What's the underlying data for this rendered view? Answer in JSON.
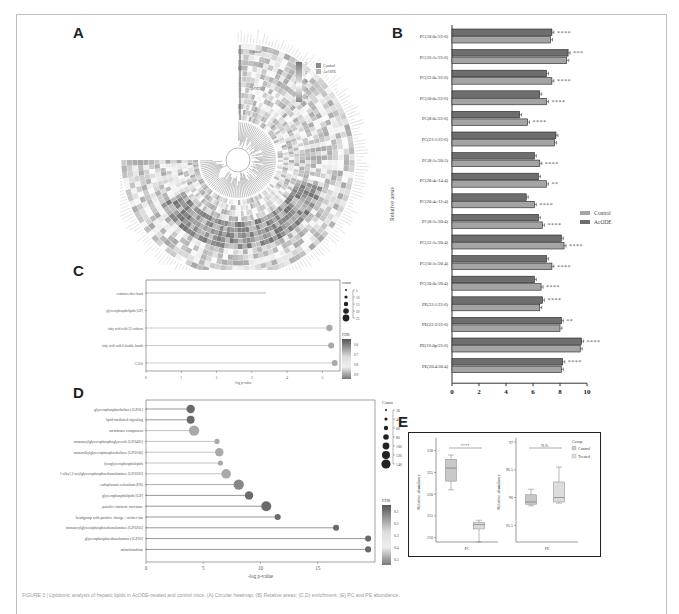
{
  "panels": {
    "A": {
      "letter": "A"
    },
    "B": {
      "letter": "B"
    },
    "C": {
      "letter": "C"
    },
    "D": {
      "letter": "D"
    },
    "E": {
      "letter": "E"
    }
  },
  "heatmap": {
    "group_labels": [
      "Control",
      "AcODE"
    ],
    "color_scale_ticks": [
      "2",
      "1",
      "0",
      "-1",
      "-2"
    ],
    "legend_groups": [
      "Control",
      "AcODE"
    ]
  },
  "chart_data": [
    {
      "panel": "A",
      "type": "heatmap",
      "title": "",
      "layout": "circular heatmap with dendrogram",
      "row_groups": [
        "Control",
        "AcODE"
      ],
      "color_scale": {
        "min": -2,
        "max": 2,
        "ticks": [
          2,
          1,
          0,
          -1,
          -2
        ]
      },
      "legend": [
        "Control",
        "AcODE"
      ]
    },
    {
      "panel": "B",
      "type": "bar",
      "orientation": "horizontal",
      "ylabel": "Relative areas",
      "xlabel": "",
      "xlim": [
        0,
        10
      ],
      "xticks": [
        0,
        2,
        4,
        6,
        8,
        10
      ],
      "legend_position": "right",
      "categories": [
        "PC(18:0e/22:6)",
        "PC(16:1e/22:6)",
        "PC(12:0e/22:6)",
        "PC(10:0e/22:6)",
        "PC(8:0e/22:6)",
        "PC(22:1/22:6)",
        "PC(8:1e/20:5)",
        "PC(20:4e/14:4)",
        "PC(20:4e/12:4)",
        "PC(8:1e/20:4)",
        "PC(12:1e/20:4)",
        "PC(10:1e/20:4)",
        "PC(10:0e/20:4)",
        "PE(32:1/22:6)",
        "PE(22:3/22:6)",
        "PE(16:0p/22:6)",
        "PE(20:4/20:4)"
      ],
      "series": [
        {
          "name": "Control",
          "values": [
            7.4,
            8.6,
            7.0,
            6.5,
            5.0,
            7.7,
            6.1,
            6.4,
            5.5,
            6.4,
            8.1,
            7.0,
            6.1,
            6.7,
            8.1,
            9.6,
            8.2
          ]
        },
        {
          "name": "AcODE",
          "values": [
            7.3,
            8.5,
            7.4,
            7.0,
            5.6,
            7.6,
            6.5,
            7.0,
            6.1,
            6.7,
            8.3,
            7.4,
            6.6,
            6.5,
            8.0,
            9.5,
            8.1
          ]
        }
      ],
      "significance": [
        "****",
        "***",
        "****",
        "****",
        "****",
        "",
        "****",
        "**",
        "****",
        "****",
        "****",
        "****",
        "****",
        "****",
        "**",
        "****",
        "****"
      ]
    },
    {
      "panel": "C",
      "type": "scatter",
      "subtype": "lollipop",
      "xlabel": "-log p-value",
      "ylabel": "",
      "xlim": [
        0,
        5.5
      ],
      "xticks": [
        0,
        1,
        2,
        3,
        4,
        5
      ],
      "categories": [
        "contains ether bond",
        "glycerophospholipids [GP]",
        "fatty acid with 22 carbons",
        "fatty acid with 6 double bonds",
        "C22:6"
      ],
      "values": [
        3.4,
        0.0,
        5.2,
        5.25,
        5.35
      ],
      "count": [
        null,
        null,
        15,
        12,
        10
      ],
      "fdr": [
        null,
        null,
        0.6,
        0.6,
        0.6
      ],
      "legend": {
        "count_title": "count",
        "count_ticks": [
          5,
          10,
          15,
          20,
          25
        ],
        "fdr_title": "FDR",
        "fdr_ticks": [
          0.6,
          0.7,
          0.8,
          0.9
        ]
      }
    },
    {
      "panel": "D",
      "type": "scatter",
      "subtype": "lollipop",
      "xlabel": "-log p-value",
      "ylabel": "",
      "xlim": [
        0,
        20
      ],
      "xticks": [
        0,
        5,
        10,
        15
      ],
      "categories": [
        "glycerophosphocholines [GP01]",
        "lipid-mediated signaling",
        "membrane component",
        "monoacylglycerophosphoglycerols [GP0405]",
        "monoalkylglycerophosphocholines [GP0106]",
        "lysoglycerophospholipids",
        "1-alkyl,2-acylglycerophosphoethanolamines [GP0202]",
        "endoplasmic reticulum (ER)",
        "glycerophospholipids [GP]",
        "positive intrinsic curvature",
        "headgroup with positive charge / zwitter-ion",
        "monoacylglycerophosphoethanolamines [GP0205]",
        "glycerophosphoethanolamines [GP02]",
        "mitochondrion"
      ],
      "values": [
        3.9,
        3.9,
        4.2,
        6.2,
        6.4,
        6.5,
        7.0,
        8.1,
        9.0,
        10.5,
        11.5,
        16.6,
        19.4,
        19.4
      ],
      "count": [
        60,
        50,
        110,
        10,
        60,
        10,
        90,
        110,
        60,
        100,
        20,
        20,
        20,
        20
      ],
      "fdr": [
        0.1,
        0.1,
        0.3,
        0.3,
        0.3,
        0.3,
        0.3,
        0.2,
        0.1,
        0.05,
        0.05,
        0.05,
        0.05,
        0.05
      ],
      "legend": {
        "count_title": "Count",
        "count_ticks": [
          20,
          40,
          60,
          80,
          100,
          120,
          140
        ],
        "fdr_title": "FDR",
        "fdr_ticks": [
          0.1,
          0.2,
          0.3,
          0.4,
          0.5
        ]
      }
    },
    {
      "panel": "E",
      "type": "box",
      "subplots": [
        {
          "xlabel": "PC",
          "ylabel": "Relative abundance",
          "yticks": [
            210,
            215,
            220,
            225,
            230
          ],
          "significance": "****",
          "groups": [
            {
              "name": "Control",
              "min": 221,
              "q1": 223,
              "median": 226,
              "q3": 228,
              "max": 229
            },
            {
              "name": "Treated",
              "min": 209,
              "q1": 212,
              "median": 213,
              "q3": 213.5,
              "max": 214
            }
          ]
        },
        {
          "xlabel": "PE",
          "ylabel": "Relative abundance",
          "yticks": [
            95.5,
            96.0,
            96.5,
            97.0
          ],
          "significance": "N.S.",
          "groups": [
            {
              "name": "Control",
              "min": 95.85,
              "q1": 95.88,
              "median": 95.92,
              "q3": 96.05,
              "max": 96.15
            },
            {
              "name": "Treated",
              "min": 95.9,
              "q1": 95.92,
              "median": 96.0,
              "q3": 96.28,
              "max": 96.55
            }
          ]
        }
      ],
      "legend": {
        "title": "Group",
        "items": [
          "Control",
          "Treated"
        ]
      }
    }
  ],
  "caption": {
    "text": "FIGURE 3 | Lipidomic analysis of hepatic lipids in AcODE-treated and control mice. (A) Circular heatmap; (B) Relative areas; (C,D) enrichment; (E) PC and PE abundance."
  }
}
